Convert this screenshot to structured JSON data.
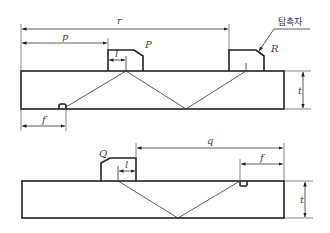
{
  "diagram": {
    "colors": {
      "line": "#222222",
      "text": "#444444",
      "background": "#ffffff"
    },
    "top_figure": {
      "labels": {
        "r": "r",
        "p": "p",
        "l": "l",
        "f": "f",
        "t": "t",
        "probe_P": "P",
        "probe_R": "R",
        "probe_callout": "탐촉자"
      }
    },
    "bottom_figure": {
      "labels": {
        "q": "q",
        "f": "f",
        "l": "l",
        "t": "t",
        "probe_Q": "Q"
      }
    }
  }
}
